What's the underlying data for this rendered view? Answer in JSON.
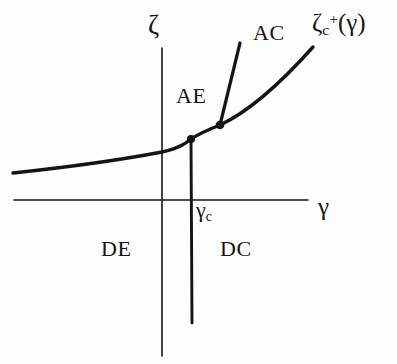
{
  "figure": {
    "type": "phase-diagram",
    "background_color": "#fdfdfd",
    "ink_color": "#141414",
    "axes": {
      "x_axis": {
        "label": "γ",
        "label_name": "gamma",
        "y_pixel": 200,
        "x_start": 14,
        "x_end": 308
      },
      "y_axis": {
        "label": "ζ",
        "label_name": "zeta",
        "x_pixel": 162,
        "y_start": 48,
        "y_end": 356
      }
    },
    "curve": {
      "label_zeta": "ζ",
      "label_sub": "c",
      "label_sup": "+",
      "label_arg": "(γ)",
      "label_full": "ζⱼ⁺(γ)",
      "description": "critical line zeta_c^+(gamma), monotonically increasing convex curve"
    },
    "branch": {
      "label": "AC",
      "description": "straight boundary segment rising from the upper kink point"
    },
    "vertical_line": {
      "label": "γ",
      "label_sub": "c",
      "label_full": "γc",
      "x_pixel": 191,
      "y_top": 139,
      "y_bottom": 323,
      "description": "vertical boundary at gamma = gamma_c"
    },
    "region_labels": [
      {
        "name": "AE",
        "text": "AE",
        "x": 176,
        "y": 85
      },
      {
        "name": "AC",
        "text": "AC",
        "x": 253,
        "y": 22
      },
      {
        "name": "DE",
        "text": "DE",
        "x": 101,
        "y": 238
      },
      {
        "name": "DC",
        "text": "DC",
        "x": 220,
        "y": 238
      }
    ],
    "points": [
      {
        "name": "lower-kink-point",
        "x": 191,
        "y": 139
      },
      {
        "name": "upper-kink-point",
        "x": 220,
        "y": 125
      }
    ]
  }
}
